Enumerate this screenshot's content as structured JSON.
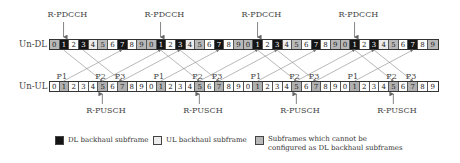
{
  "diagram": {
    "rows": {
      "dl": {
        "label": "Un-DL",
        "cells": [
          {
            "n": "0",
            "t": "gray"
          },
          {
            "n": "1",
            "t": "black"
          },
          {
            "n": "2",
            "t": "white"
          },
          {
            "n": "3",
            "t": "black"
          },
          {
            "n": "4",
            "t": "light"
          },
          {
            "n": "5",
            "t": "gray"
          },
          {
            "n": "6",
            "t": "white"
          },
          {
            "n": "7",
            "t": "black"
          },
          {
            "n": "8",
            "t": "white"
          },
          {
            "n": "9",
            "t": "gray"
          },
          {
            "n": "0",
            "t": "gray"
          },
          {
            "n": "1",
            "t": "black"
          },
          {
            "n": "2",
            "t": "white"
          },
          {
            "n": "3",
            "t": "black"
          },
          {
            "n": "4",
            "t": "light"
          },
          {
            "n": "5",
            "t": "gray"
          },
          {
            "n": "6",
            "t": "white"
          },
          {
            "n": "7",
            "t": "black"
          },
          {
            "n": "8",
            "t": "white"
          },
          {
            "n": "9",
            "t": "gray"
          },
          {
            "n": "0",
            "t": "gray"
          },
          {
            "n": "1",
            "t": "black"
          },
          {
            "n": "2",
            "t": "white"
          },
          {
            "n": "3",
            "t": "black"
          },
          {
            "n": "4",
            "t": "light"
          },
          {
            "n": "5",
            "t": "gray"
          },
          {
            "n": "6",
            "t": "white"
          },
          {
            "n": "7",
            "t": "black"
          },
          {
            "n": "8",
            "t": "white"
          },
          {
            "n": "9",
            "t": "gray"
          },
          {
            "n": "0",
            "t": "gray"
          },
          {
            "n": "1",
            "t": "black"
          },
          {
            "n": "2",
            "t": "white"
          },
          {
            "n": "3",
            "t": "black"
          },
          {
            "n": "4",
            "t": "light"
          },
          {
            "n": "5",
            "t": "gray"
          },
          {
            "n": "6",
            "t": "white"
          },
          {
            "n": "7",
            "t": "black"
          },
          {
            "n": "8",
            "t": "white"
          },
          {
            "n": "9",
            "t": "gray"
          }
        ]
      },
      "ul": {
        "label": "Un-UL",
        "cells": [
          {
            "n": "0",
            "t": "white"
          },
          {
            "n": "1",
            "t": "ulhl"
          },
          {
            "n": "2",
            "t": "white"
          },
          {
            "n": "3",
            "t": "white"
          },
          {
            "n": "4",
            "t": "white"
          },
          {
            "n": "5",
            "t": "ulhl"
          },
          {
            "n": "6",
            "t": "white"
          },
          {
            "n": "7",
            "t": "ulhl"
          },
          {
            "n": "8",
            "t": "white"
          },
          {
            "n": "9",
            "t": "white"
          },
          {
            "n": "0",
            "t": "white"
          },
          {
            "n": "1",
            "t": "ulhl"
          },
          {
            "n": "2",
            "t": "white"
          },
          {
            "n": "3",
            "t": "white"
          },
          {
            "n": "4",
            "t": "white"
          },
          {
            "n": "5",
            "t": "ulhl"
          },
          {
            "n": "6",
            "t": "white"
          },
          {
            "n": "7",
            "t": "ulhl"
          },
          {
            "n": "8",
            "t": "white"
          },
          {
            "n": "9",
            "t": "white"
          },
          {
            "n": "0",
            "t": "white"
          },
          {
            "n": "1",
            "t": "ulhl"
          },
          {
            "n": "2",
            "t": "white"
          },
          {
            "n": "3",
            "t": "white"
          },
          {
            "n": "4",
            "t": "white"
          },
          {
            "n": "5",
            "t": "ulhl"
          },
          {
            "n": "6",
            "t": "white"
          },
          {
            "n": "7",
            "t": "ulhl"
          },
          {
            "n": "8",
            "t": "white"
          },
          {
            "n": "9",
            "t": "white"
          },
          {
            "n": "0",
            "t": "white"
          },
          {
            "n": "1",
            "t": "ulhl"
          },
          {
            "n": "2",
            "t": "white"
          },
          {
            "n": "3",
            "t": "white"
          },
          {
            "n": "4",
            "t": "white"
          },
          {
            "n": "5",
            "t": "ulhl"
          },
          {
            "n": "6",
            "t": "white"
          },
          {
            "n": "7",
            "t": "ulhl"
          },
          {
            "n": "8",
            "t": "white"
          },
          {
            "n": "9",
            "t": "white"
          }
        ]
      }
    },
    "top_labels": [
      "R-PDCCH",
      "R-PDCCH",
      "R-PDCCH",
      "R-PDCCH"
    ],
    "bottom_labels": [
      "R-PUSCH",
      "R-PUSCH",
      "R-PUSCH",
      "R-PUSCH"
    ],
    "process_labels": [
      "P1",
      "P2",
      "P3"
    ],
    "legend": [
      {
        "label": "DL backhaul subframe",
        "color": "#151515"
      },
      {
        "label": "UL backhaul subframe",
        "color": "#ececec"
      },
      {
        "label": "Subframes which cannot be",
        "label2": "configured as DL backhaul subframes",
        "color": "#b8b8b8"
      }
    ]
  }
}
